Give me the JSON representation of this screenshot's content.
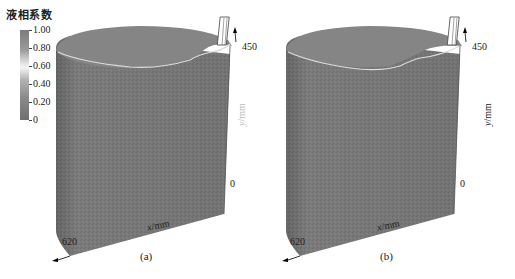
{
  "legend": {
    "title": "液相系数",
    "ticks": [
      "1.00",
      "0.80",
      "0.60",
      "0.40",
      "0.20",
      "0"
    ],
    "gradient": [
      "#7c7c7c",
      "#9a9a9a",
      "#f4f4f4",
      "#b4b4b4",
      "#707070"
    ]
  },
  "panels": [
    {
      "id": "a",
      "caption": "(a)",
      "y_axis": {
        "label_var": "y",
        "label_unit": "/mm",
        "max": "450",
        "min": "0"
      },
      "x_axis": {
        "label_var": "x",
        "label_unit": "/mm",
        "max": "620",
        "min": "0"
      }
    },
    {
      "id": "b",
      "caption": "(b)",
      "y_axis": {
        "label_var": "y",
        "label_unit": "/mm",
        "max": "450",
        "min": "0"
      },
      "x_axis": {
        "label_var": "x",
        "label_unit": "/mm",
        "max": "620",
        "min": "0"
      }
    }
  ],
  "colors": {
    "body": "#7a7a7a",
    "top_surface": "#858585",
    "contour_line": "#d8d8d8",
    "edge": "#555555"
  }
}
